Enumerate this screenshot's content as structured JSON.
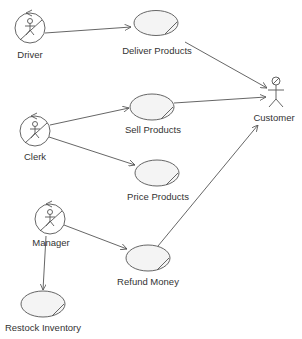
{
  "diagram": {
    "type": "UML Use Case Diagram",
    "colors": {
      "line": "#555555",
      "ellipse_fill": "#f4f4f4",
      "text": "#333333"
    },
    "actors": [
      {
        "id": "driver",
        "label": "Driver",
        "style": "business-actor"
      },
      {
        "id": "clerk",
        "label": "Clerk",
        "style": "business-actor"
      },
      {
        "id": "manager",
        "label": "Manager",
        "style": "business-actor"
      },
      {
        "id": "customer",
        "label": "Customer",
        "style": "stick-figure"
      }
    ],
    "use_cases": [
      {
        "id": "deliver",
        "label": "Deliver Products"
      },
      {
        "id": "sell",
        "label": "Sell Products"
      },
      {
        "id": "price",
        "label": "Price Products"
      },
      {
        "id": "refund",
        "label": "Refund Money"
      },
      {
        "id": "restock",
        "label": "Restock Inventory"
      }
    ],
    "associations": [
      {
        "from": "Driver",
        "to": "Deliver Products"
      },
      {
        "from": "Deliver Products",
        "to": "Customer"
      },
      {
        "from": "Clerk",
        "to": "Sell Products"
      },
      {
        "from": "Sell Products",
        "to": "Customer"
      },
      {
        "from": "Clerk",
        "to": "Price Products"
      },
      {
        "from": "Manager",
        "to": "Refund Money"
      },
      {
        "from": "Refund Money",
        "to": "Customer"
      },
      {
        "from": "Manager",
        "to": "Restock Inventory"
      }
    ]
  }
}
